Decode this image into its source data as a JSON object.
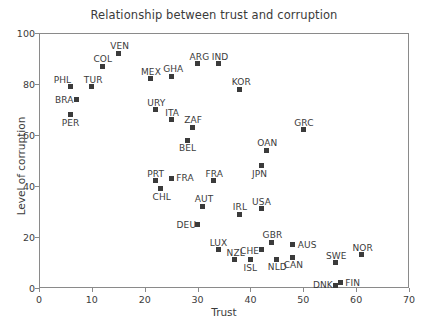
{
  "chart_data": {
    "type": "scatter",
    "title": "Relationship between trust and corruption",
    "xlabel": "Trust",
    "ylabel": "Level of corruption",
    "xlim": [
      0,
      70
    ],
    "ylim": [
      0,
      100
    ],
    "xticks": [
      0,
      10,
      20,
      30,
      40,
      50,
      60,
      70
    ],
    "yticks": [
      0,
      20,
      40,
      60,
      80,
      100
    ],
    "grid": false,
    "legend": null,
    "marker": "square",
    "marker_color": "#3b3b3b",
    "points": [
      {
        "label": "PHL",
        "x": 6,
        "y": 79,
        "lx": -17,
        "ly": -12
      },
      {
        "label": "TUR",
        "x": 10,
        "y": 79,
        "lx": -8,
        "ly": -12
      },
      {
        "label": "BRA",
        "x": 7,
        "y": 74,
        "lx": -21,
        "ly": -4
      },
      {
        "label": "PER",
        "x": 6,
        "y": 68,
        "lx": -9,
        "ly": 3
      },
      {
        "label": "COL",
        "x": 12,
        "y": 87,
        "lx": -9,
        "ly": -12
      },
      {
        "label": "VEN",
        "x": 15,
        "y": 92,
        "lx": -8,
        "ly": -12
      },
      {
        "label": "MEX",
        "x": 21,
        "y": 82,
        "lx": -9,
        "ly": -12
      },
      {
        "label": "GHA",
        "x": 25,
        "y": 83,
        "lx": -8,
        "ly": -12
      },
      {
        "label": "ARG",
        "x": 30,
        "y": 88,
        "lx": -8,
        "ly": -12
      },
      {
        "label": "IND",
        "x": 34,
        "y": 88,
        "lx": -7,
        "ly": -12
      },
      {
        "label": "KOR",
        "x": 38,
        "y": 78,
        "lx": -8,
        "ly": -12
      },
      {
        "label": "URY",
        "x": 22,
        "y": 70,
        "lx": -8,
        "ly": -12
      },
      {
        "label": "ITA",
        "x": 25,
        "y": 66,
        "lx": -6,
        "ly": -12
      },
      {
        "label": "ZAF",
        "x": 29,
        "y": 63,
        "lx": -8,
        "ly": -12
      },
      {
        "label": "BEL",
        "x": 28,
        "y": 58,
        "lx": -8,
        "ly": 3
      },
      {
        "label": "GRC",
        "x": 50,
        "y": 62,
        "lx": -9,
        "ly": -12
      },
      {
        "label": "OAN",
        "x": 43,
        "y": 54,
        "lx": -9,
        "ly": -12
      },
      {
        "label": "JPN",
        "x": 42,
        "y": 48,
        "lx": -9,
        "ly": 3
      },
      {
        "label": "PRT",
        "x": 22,
        "y": 42,
        "lx": -8,
        "ly": -12
      },
      {
        "label": "FRA",
        "x": 25,
        "y": 43,
        "lx": 5,
        "ly": -5
      },
      {
        "label": "CHL",
        "x": 23,
        "y": 39,
        "lx": -8,
        "ly": 3
      },
      {
        "label": "FRA",
        "x": 33,
        "y": 42,
        "lx": -8,
        "ly": -12
      },
      {
        "label": "AUT",
        "x": 31,
        "y": 32,
        "lx": -8,
        "ly": -12
      },
      {
        "label": "IRL",
        "x": 38,
        "y": 29,
        "lx": -7,
        "ly": -12
      },
      {
        "label": "USA",
        "x": 42,
        "y": 31,
        "lx": -9,
        "ly": -12
      },
      {
        "label": "DEU",
        "x": 30,
        "y": 25,
        "lx": -21,
        "ly": -4
      },
      {
        "label": "LUX",
        "x": 34,
        "y": 15,
        "lx": -9,
        "ly": -12
      },
      {
        "label": "NZL",
        "x": 37,
        "y": 11,
        "lx": -8,
        "ly": -12
      },
      {
        "label": "ISL",
        "x": 40,
        "y": 11,
        "lx": -7,
        "ly": 3
      },
      {
        "label": "CHE",
        "x": 42,
        "y": 15,
        "lx": -21,
        "ly": -4
      },
      {
        "label": "GBR",
        "x": 44,
        "y": 18,
        "lx": -9,
        "ly": -12
      },
      {
        "label": "NLD",
        "x": 45,
        "y": 11,
        "lx": -9,
        "ly": 2
      },
      {
        "label": "AUS",
        "x": 48,
        "y": 17,
        "lx": 5,
        "ly": -5
      },
      {
        "label": "CAN",
        "x": 48,
        "y": 12,
        "lx": -9,
        "ly": 3
      },
      {
        "label": "SWE",
        "x": 56,
        "y": 10,
        "lx": -9,
        "ly": -12
      },
      {
        "label": "DNK",
        "x": 56,
        "y": 1,
        "lx": -22,
        "ly": -5
      },
      {
        "label": "FIN",
        "x": 57,
        "y": 2,
        "lx": 5,
        "ly": -5
      },
      {
        "label": "NOR",
        "x": 61,
        "y": 13,
        "lx": -9,
        "ly": -12
      }
    ]
  }
}
